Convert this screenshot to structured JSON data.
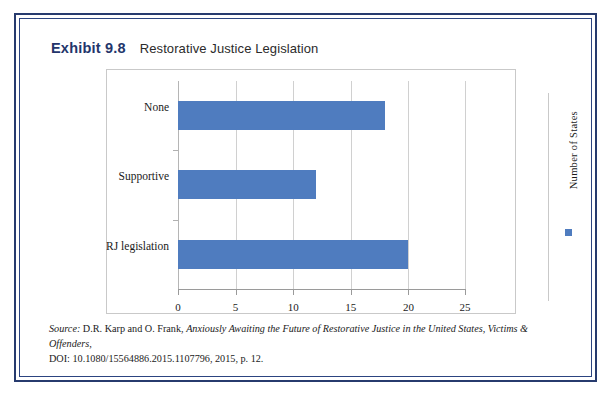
{
  "exhibit": {
    "label": "Exhibit 9.8",
    "caption": "Restorative Justice Legislation"
  },
  "colors": {
    "bar": "#4f7cbf",
    "frame_navy": "#273b6e",
    "title_navy": "#23356b",
    "gridline": "#d0d0d0"
  },
  "legend": {
    "text": "Number of States",
    "marker": "blue-square"
  },
  "source": {
    "lead": "Source:",
    "authors": " D.R. Karp and O. Frank, ",
    "title": "Anxiously Awaiting the Future of Restorative Justice in the United States, Victims & Offenders,",
    "doi": "DOI: 10.1080/15564886.2015.1107796, 2015, p. 12."
  },
  "chart_data": {
    "type": "bar",
    "orientation": "horizontal",
    "title": "Restorative Justice Legislation",
    "categories": [
      "RJ legislation",
      "Supportive",
      "None"
    ],
    "values": [
      20,
      12,
      18
    ],
    "series": [
      {
        "name": "Number of States",
        "values": [
          20,
          12,
          18
        ]
      }
    ],
    "xlabel": "",
    "ylabel": "",
    "xlim": [
      0,
      25
    ],
    "xticks": [
      0,
      5,
      10,
      15,
      20,
      25
    ],
    "xtick_labels": [
      "0",
      "5",
      "10",
      "15",
      "20",
      "25"
    ],
    "grid": true,
    "grid_axis": "x",
    "legend_position": "right",
    "legend_entries": [
      "Number of States"
    ],
    "bar_color": "#4f7cbf"
  }
}
